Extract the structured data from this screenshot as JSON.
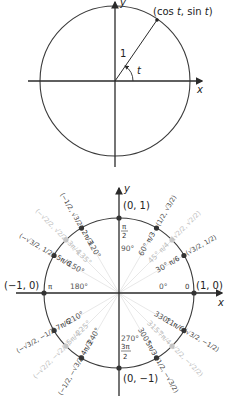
{
  "top_diagram": {
    "point_label": "(cos t, sin t)",
    "point_label_parts": {
      "open": "(cos ",
      "t1": "t",
      "mid": ", sin ",
      "t2": "t",
      "close": ")"
    },
    "radius_label": "1",
    "angle_label": "t",
    "x_axis_label": "x",
    "y_axis_label": "y"
  },
  "bottom_diagram": {
    "x_axis_label": "x",
    "y_axis_label": "y",
    "axis_points": [
      {
        "coord": "(1, 0)",
        "rad": "0",
        "deg": "0°"
      },
      {
        "coord": "(0, 1)",
        "rad": "π/2",
        "deg": "90°"
      },
      {
        "coord": "(−1, 0)",
        "rad": "π",
        "deg": "180°"
      },
      {
        "coord": "(0, −1)",
        "rad": "3π/2",
        "deg": "270°"
      }
    ],
    "angles": [
      {
        "deg": "30°",
        "rad_num": "π",
        "rad_den": "6",
        "coord": "(√3/2, 1/2)",
        "shade": "dark"
      },
      {
        "deg": "45°",
        "rad_num": "π",
        "rad_den": "4",
        "coord": "(√2/2, √2/2)",
        "shade": "light"
      },
      {
        "deg": "60°",
        "rad_num": "π",
        "rad_den": "3",
        "coord": "(1/2, √3/2)",
        "shade": "dark"
      },
      {
        "deg": "120°",
        "rad_num": "2π",
        "rad_den": "3",
        "coord": "(−1/2, √3/2)",
        "shade": "dark"
      },
      {
        "deg": "135°",
        "rad_num": "3π",
        "rad_den": "4",
        "coord": "(−√2/2, √2/2)",
        "shade": "light"
      },
      {
        "deg": "150°",
        "rad_num": "5π",
        "rad_den": "6",
        "coord": "(−√3/2, 1/2)",
        "shade": "dark"
      },
      {
        "deg": "210°",
        "rad_num": "7π",
        "rad_den": "6",
        "coord": "(−√3/2, −1/2)",
        "shade": "dark"
      },
      {
        "deg": "225°",
        "rad_num": "5π",
        "rad_den": "4",
        "coord": "(−√2/2, −√2/2)",
        "shade": "light"
      },
      {
        "deg": "240°",
        "rad_num": "4π",
        "rad_den": "3",
        "coord": "(−1/2, −√3/2)",
        "shade": "dark"
      },
      {
        "deg": "300°",
        "rad_num": "5π",
        "rad_den": "3",
        "coord": "(1/2, −√3/2)",
        "shade": "dark"
      },
      {
        "deg": "315°",
        "rad_num": "7π",
        "rad_den": "4",
        "coord": "(√2/2, −√2/2)",
        "shade": "light"
      },
      {
        "deg": "330°",
        "rad_num": "11π",
        "rad_den": "6",
        "coord": "(√3/2, −1/2)",
        "shade": "dark"
      }
    ]
  },
  "colors": {
    "line": "#333333",
    "light_label": "#bdbdbd",
    "dark_dot": "#333333",
    "light_dot": "#c8c8c8"
  }
}
